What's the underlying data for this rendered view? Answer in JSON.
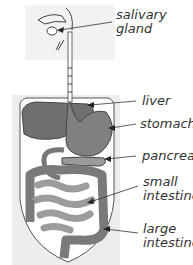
{
  "diagram": {
    "labels": [
      {
        "line1": "salivary",
        "line2": "gland"
      },
      {
        "line1": "liver",
        "line2": ""
      },
      {
        "line1": "stomach",
        "line2": ""
      },
      {
        "line1": "pancreas",
        "line2": ""
      },
      {
        "line1": "small",
        "line2": "intestine"
      },
      {
        "line1": "large",
        "line2": "intestine"
      }
    ],
    "colors": {
      "organ_dark": "#6e6e6e",
      "organ_mid": "#8c8c8c",
      "organ_light": "#a8a8a8",
      "body_bg": "#ececec",
      "outline": "#444444"
    }
  }
}
